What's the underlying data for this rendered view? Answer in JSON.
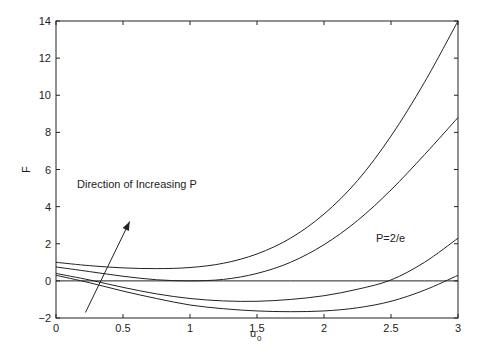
{
  "chart_data": {
    "type": "line",
    "title": "",
    "xlabel": "u",
    "xlabel_subscript": "0",
    "ylabel": "F",
    "xlim": [
      0,
      3
    ],
    "ylim": [
      -2,
      14
    ],
    "x_ticks": [
      "0",
      "0.5",
      "1",
      "1.5",
      "2",
      "2.5",
      "3"
    ],
    "y_ticks": [
      "-2",
      "0",
      "2",
      "4",
      "6",
      "8",
      "10",
      "12",
      "14"
    ],
    "grid": false,
    "legend": null,
    "annotations": [
      {
        "text": "Direction of Increasing P",
        "x": 0.42,
        "y": 4.7
      },
      {
        "text": "P=2/e",
        "x": 2.35,
        "y": 1.2
      }
    ],
    "arrow": {
      "from": [
        0.22,
        -1.7
      ],
      "to": [
        0.55,
        3.2
      ]
    },
    "x": [
      0,
      0.25,
      0.5,
      0.75,
      1.0,
      1.25,
      1.5,
      1.75,
      2.0,
      2.25,
      2.5,
      2.75,
      3.0
    ],
    "series": [
      {
        "name": "curve-1 (largest P)",
        "values": [
          1.0,
          0.82,
          0.7,
          0.66,
          0.72,
          0.95,
          1.45,
          2.3,
          3.6,
          5.4,
          7.8,
          10.7,
          14.0
        ]
      },
      {
        "name": "curve-2 (P=2/e)",
        "values": [
          0.75,
          0.5,
          0.25,
          0.06,
          0.0,
          0.08,
          0.4,
          1.0,
          1.95,
          3.25,
          4.9,
          6.8,
          8.8
        ]
      },
      {
        "name": "curve-3",
        "values": [
          0.4,
          0.05,
          -0.35,
          -0.7,
          -0.95,
          -1.08,
          -1.1,
          -1.0,
          -0.8,
          -0.45,
          0.05,
          1.0,
          2.3
        ]
      },
      {
        "name": "curve-4 (smallest P)",
        "values": [
          0.3,
          -0.1,
          -0.55,
          -0.95,
          -1.3,
          -1.5,
          -1.62,
          -1.66,
          -1.62,
          -1.45,
          -1.1,
          -0.5,
          0.3
        ]
      },
      {
        "name": "zero-line",
        "values": [
          0,
          0,
          0,
          0,
          0,
          0,
          0,
          0,
          0,
          0,
          0,
          0,
          0
        ]
      }
    ]
  },
  "colors": {
    "line": "#222222",
    "background": "#ffffff"
  }
}
